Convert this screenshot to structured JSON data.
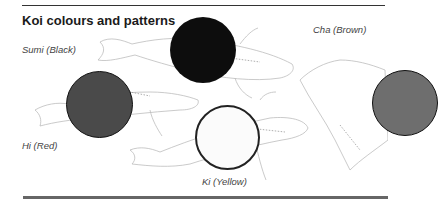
{
  "title": "Koi colours and patterns",
  "labels": {
    "sumi": "Sumi (Black)",
    "cha": "Cha (Brown)",
    "hi": "Hi (Red)",
    "ki": "Ki (Yellow)"
  },
  "swatches": [
    {
      "name": "Sumi",
      "color": "#0d0d0d"
    },
    {
      "name": "Hi",
      "color": "#4a4a4a"
    },
    {
      "name": "Ki",
      "color": "#fbfbfb"
    },
    {
      "name": "Cha",
      "color": "#6e6e6e"
    }
  ],
  "illustration": "koi-fish-sketches"
}
